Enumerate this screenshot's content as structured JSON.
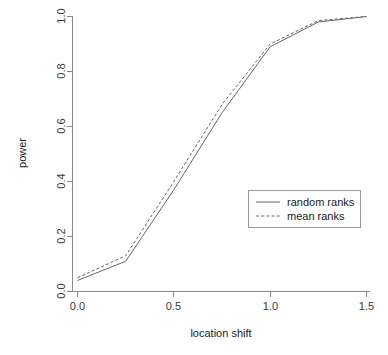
{
  "chart_data": {
    "type": "line",
    "title": "",
    "xlabel": "location shift",
    "ylabel": "power",
    "xlim": [
      0.0,
      1.5
    ],
    "ylim": [
      0.0,
      1.0
    ],
    "xticks": [
      "0.0",
      "0.5",
      "1.0",
      "1.5"
    ],
    "xtick_values": [
      0.0,
      0.5,
      1.0,
      1.5
    ],
    "yticks": [
      "0.0",
      "0.2",
      "0.4",
      "0.6",
      "0.8",
      "1.0"
    ],
    "ytick_values": [
      0.0,
      0.2,
      0.4,
      0.6,
      0.8,
      1.0
    ],
    "grid": false,
    "legend_position": "right-middle",
    "x": [
      0.0,
      0.25,
      0.5,
      0.75,
      1.0,
      1.25,
      1.5
    ],
    "series": [
      {
        "name": "random ranks",
        "style": "solid",
        "color": "#666666",
        "values": [
          0.04,
          0.11,
          0.37,
          0.65,
          0.89,
          0.98,
          1.0
        ]
      },
      {
        "name": "mean ranks",
        "style": "dashed",
        "color": "#666666",
        "values": [
          0.05,
          0.13,
          0.4,
          0.68,
          0.9,
          0.985,
          1.0
        ]
      }
    ]
  },
  "legend": {
    "entries": [
      {
        "label": "random ranks",
        "style": "solid"
      },
      {
        "label": "mean ranks",
        "style": "dashed"
      }
    ]
  },
  "axes": {
    "x_title": "location shift",
    "y_title": "power"
  }
}
